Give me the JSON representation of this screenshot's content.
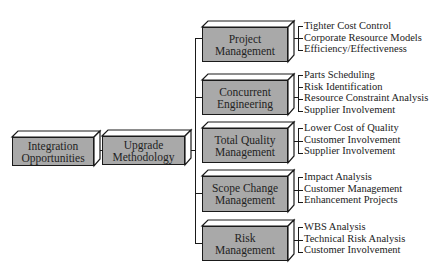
{
  "root": {
    "label_line1": "Integration",
    "label_line2": "Opportunities"
  },
  "middle": {
    "label_line1": "Upgrade",
    "label_line2": "Methodology"
  },
  "branches": [
    {
      "label_line1": "Project",
      "label_line2": "Management",
      "items": [
        "Tighter Cost Control",
        "Corporate Resource Models",
        "Efficiency/Effectiveness"
      ]
    },
    {
      "label_line1": "Concurrent",
      "label_line2": "Engineering",
      "items": [
        "Parts Scheduling",
        "Risk Identification",
        "Resource Constraint Analysis",
        "Supplier Involvement"
      ]
    },
    {
      "label_line1": "Total Quality",
      "label_line2": "Management",
      "items": [
        "Lower Cost of Quality",
        "Customer Involvement",
        "Supplier Involvement"
      ]
    },
    {
      "label_line1": "Scope Change",
      "label_line2": "Management",
      "items": [
        "Impact Analysis",
        "Customer Management",
        "Enhancement Projects"
      ]
    },
    {
      "label_line1": "Risk",
      "label_line2": "Management",
      "items": [
        "WBS Analysis",
        "Technical Risk Analysis",
        "Customer Involvement"
      ]
    }
  ],
  "colors": {
    "box_fill": "#a9a9a9",
    "bevel_fill": "#ffffff",
    "stroke": "#1a1a1a"
  }
}
